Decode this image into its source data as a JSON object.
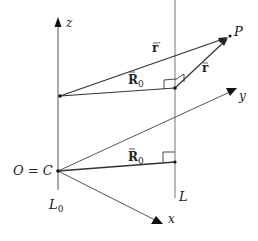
{
  "diagram": {
    "type": "vector-geometry",
    "colors": {
      "line": "#333333",
      "thin_line": "#666666",
      "text": "#222222",
      "background": "#ffffff"
    },
    "axes": {
      "z": {
        "label": "z"
      },
      "y": {
        "label": "y"
      },
      "x": {
        "label": "x"
      }
    },
    "lines": {
      "L0": {
        "label": "L",
        "subscript": "0"
      },
      "L": {
        "label": "L"
      }
    },
    "points": {
      "origin": {
        "label": "O = C"
      },
      "P": {
        "label": "P"
      }
    },
    "vectors": {
      "r_prime": {
        "label": "r",
        "accent": "⃗",
        "prime": "′"
      },
      "r": {
        "label": "r",
        "accent": "⃗"
      },
      "R0_upper": {
        "label": "R",
        "subscript": "0"
      },
      "R0_lower": {
        "label": "R",
        "subscript": "0"
      }
    }
  }
}
